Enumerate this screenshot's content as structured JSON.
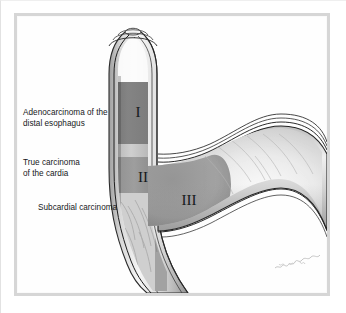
{
  "figure": {
    "kind": "medical-illustration",
    "signature_text": "artist signature",
    "frame_color": "#d6d6d6",
    "background_color": "#ffffff"
  },
  "labels": [
    {
      "id": "adenocarcinoma-distal-esophagus",
      "text": "Adenocarcinoma of the\ndistal esophagus",
      "zone": "I"
    },
    {
      "id": "true-carcinoma-cardia",
      "text": "True carcinoma\nof the cardia",
      "zone": "II"
    },
    {
      "id": "subcardial-carcinoma",
      "text": "Subcardial carcinoma",
      "zone": "III"
    }
  ],
  "zone_markers": [
    {
      "id": "zone-marker-1",
      "text": "I",
      "color": "#15181b"
    },
    {
      "id": "zone-marker-2",
      "text": "II",
      "color": "#15181b"
    },
    {
      "id": "zone-marker-3",
      "text": "III",
      "color": "#15181b"
    }
  ],
  "anatomy": {
    "esophagus_label": "distal esophagus",
    "cardia_label": "cardia",
    "stomach_label": "stomach fundus and body",
    "wall_layer_color": "#1a1a1a",
    "lumen_color": "#f2f2f2",
    "tumor_zone_color": "#7a7a7a"
  }
}
